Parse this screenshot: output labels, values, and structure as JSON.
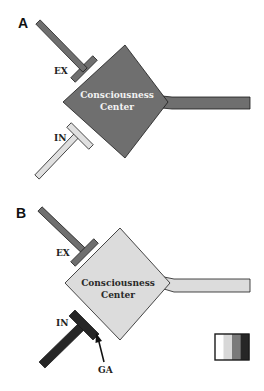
{
  "colors": {
    "outline": "#1a1a1a",
    "white": "#ffffff",
    "light": "#dedede",
    "mid": "#7a7a7a",
    "dark": "#2a2a2a"
  },
  "panels": [
    {
      "label": "A",
      "center": {
        "line1": "Consciousness",
        "line2": "Center",
        "fill": "#6f6f6f",
        "text_color": "#f2f2f2"
      },
      "excitatory": {
        "label": "EX",
        "fill": "#6f6f6f"
      },
      "inhibitory": {
        "label": "IN",
        "fill": "#e0e0e0"
      },
      "axon_fill": "#6f6f6f",
      "annotation": null
    },
    {
      "label": "B",
      "center": {
        "line1": "Consciousness",
        "line2": "Center",
        "fill": "#dcdcdc",
        "text_color": "#2a2a2a"
      },
      "excitatory": {
        "label": "EX",
        "fill": "#6f6f6f"
      },
      "inhibitory": {
        "label": "IN",
        "fill": "#262626"
      },
      "axon_fill": "#dcdcdc",
      "annotation": {
        "label": "GA",
        "target": "inhibitory synapse"
      }
    }
  ],
  "legend": {
    "type": "grayscale activity scale",
    "steps": [
      "#ffffff",
      "#d8d8d8",
      "#7a7a7a",
      "#262626"
    ]
  }
}
